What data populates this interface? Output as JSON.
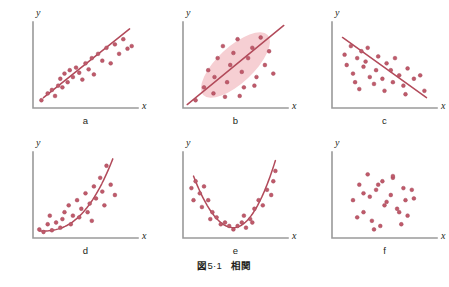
{
  "figure": {
    "caption_label": "図",
    "caption_number": "5·1",
    "caption_title": "相関",
    "background_color": "#ffffff",
    "axis_color": "#9a9a9a",
    "point_color": "#c05a6a",
    "point_stroke_color": "#a4485c",
    "curve_color": "#b24a5a",
    "ellipse_fill_color": "#f6cfd3",
    "label_color": "#231f20",
    "axis_label_x": "x",
    "axis_label_y": "y",
    "point_radius": 1.9,
    "panel_width": 149.6,
    "panel_height": 130
  },
  "chart_data": [
    {
      "type": "scatter",
      "panel_id": "a",
      "label": "a",
      "title": "",
      "xlabel": "x",
      "ylabel": "y",
      "xlim": [
        0,
        100
      ],
      "ylim": [
        0,
        100
      ],
      "grid": false,
      "legend": "none",
      "annotation": "strong positive linear correlation",
      "fit": {
        "kind": "line",
        "x1": 10,
        "y1": 12,
        "x2": 92,
        "y2": 92
      },
      "ellipse": null,
      "x": [
        8,
        14,
        18,
        21,
        24,
        26,
        28,
        30,
        33,
        35,
        38,
        41,
        44,
        47,
        50,
        53,
        56,
        58,
        62,
        66,
        70,
        74,
        78,
        82,
        86,
        90,
        94
      ],
      "y": [
        9,
        17,
        21,
        14,
        26,
        34,
        24,
        40,
        30,
        44,
        36,
        47,
        41,
        33,
        52,
        45,
        58,
        39,
        63,
        55,
        70,
        52,
        74,
        63,
        80,
        69,
        72
      ]
    },
    {
      "type": "scatter",
      "panel_id": "b",
      "label": "b",
      "title": "",
      "xlabel": "x",
      "ylabel": "y",
      "xlim": [
        0,
        100
      ],
      "ylim": [
        0,
        100
      ],
      "grid": false,
      "legend": "none",
      "annotation": "positive correlation with confidence ellipse",
      "fit": {
        "kind": "line",
        "x1": 4,
        "y1": 4,
        "x2": 96,
        "y2": 96
      },
      "ellipse": {
        "cx": 50,
        "cy": 50,
        "rx": 42,
        "ry": 21,
        "rotation_deg": -43
      },
      "x": [
        12,
        20,
        24,
        29,
        33,
        30,
        38,
        42,
        45,
        48,
        40,
        52,
        56,
        58,
        62,
        54,
        66,
        70,
        74,
        68,
        78,
        82,
        86
      ],
      "y": [
        9,
        24,
        44,
        17,
        58,
        36,
        72,
        30,
        50,
        64,
        13,
        80,
        42,
        24,
        58,
        14,
        70,
        36,
        82,
        26,
        50,
        66,
        40
      ]
    },
    {
      "type": "scatter",
      "panel_id": "c",
      "label": "c",
      "title": "",
      "xlabel": "x",
      "ylabel": "y",
      "xlim": [
        0,
        100
      ],
      "ylim": [
        0,
        100
      ],
      "grid": false,
      "legend": "none",
      "annotation": "negative linear correlation",
      "fit": {
        "kind": "line",
        "x1": 10,
        "y1": 82,
        "x2": 90,
        "y2": 12
      },
      "ellipse": null,
      "x": [
        12,
        14,
        18,
        20,
        24,
        22,
        28,
        30,
        26,
        34,
        36,
        32,
        40,
        44,
        42,
        48,
        52,
        50,
        56,
        60,
        58,
        64,
        68,
        72,
        70,
        78,
        84,
        88
      ],
      "y": [
        62,
        50,
        72,
        40,
        58,
        30,
        66,
        48,
        22,
        70,
        36,
        54,
        28,
        60,
        44,
        34,
        52,
        20,
        44,
        58,
        30,
        38,
        26,
        46,
        16,
        34,
        38,
        20
      ]
    },
    {
      "type": "scatter",
      "panel_id": "d",
      "label": "d",
      "title": "",
      "xlabel": "x",
      "ylabel": "y",
      "xlim": [
        0,
        100
      ],
      "ylim": [
        0,
        100
      ],
      "grid": false,
      "legend": "none",
      "annotation": "increasing exponential (non-linear) relationship",
      "fit": {
        "kind": "exponential",
        "x_start": 6,
        "x_end": 76,
        "y_start": 8,
        "y_end": 92,
        "curvature": 2.6
      },
      "ellipse": null,
      "x": [
        6,
        10,
        14,
        18,
        16,
        22,
        26,
        30,
        28,
        34,
        38,
        36,
        42,
        46,
        44,
        50,
        54,
        52,
        58,
        60,
        56,
        64,
        66,
        70,
        68,
        74,
        78
      ],
      "y": [
        10,
        7,
        16,
        9,
        26,
        18,
        12,
        30,
        22,
        38,
        26,
        16,
        44,
        34,
        24,
        52,
        40,
        30,
        60,
        46,
        20,
        70,
        54,
        84,
        38,
        62,
        50
      ]
    },
    {
      "type": "scatter",
      "panel_id": "e",
      "label": "e",
      "title": "",
      "xlabel": "x",
      "ylabel": "y",
      "xlim": [
        0,
        100
      ],
      "ylim": [
        0,
        100
      ],
      "grid": false,
      "legend": "none",
      "annotation": "U-shaped (quadratic) relationship",
      "fit": {
        "kind": "parabola",
        "vertex_x": 48,
        "vertex_y": 12,
        "x_start": 10,
        "x_end": 88,
        "y_start": 72,
        "y_end": 90
      },
      "ellipse": null,
      "x": [
        8,
        12,
        10,
        16,
        20,
        18,
        24,
        28,
        26,
        32,
        36,
        40,
        44,
        48,
        52,
        56,
        60,
        58,
        64,
        68,
        66,
        72,
        76,
        80,
        84,
        88,
        86
      ],
      "y": [
        58,
        66,
        44,
        52,
        60,
        36,
        44,
        30,
        22,
        24,
        16,
        18,
        14,
        10,
        14,
        18,
        12,
        26,
        22,
        34,
        18,
        44,
        38,
        56,
        50,
        78,
        66
      ]
    },
    {
      "type": "scatter",
      "panel_id": "f",
      "label": "f",
      "title": "",
      "xlabel": "x",
      "ylabel": "y",
      "xlim": [
        0,
        100
      ],
      "ylim": [
        0,
        100
      ],
      "grid": false,
      "legend": "none",
      "annotation": "no correlation (random scatter)",
      "fit": null,
      "ellipse": null,
      "x": [
        20,
        26,
        34,
        30,
        42,
        38,
        48,
        52,
        46,
        58,
        62,
        56,
        68,
        72,
        66,
        78,
        24,
        36,
        50,
        64,
        76,
        44,
        30,
        58,
        70,
        40
      ],
      "y": [
        44,
        62,
        74,
        30,
        56,
        20,
        66,
        42,
        14,
        70,
        34,
        50,
        58,
        26,
        16,
        46,
        24,
        48,
        38,
        30,
        56,
        62,
        52,
        72,
        44,
        10
      ]
    }
  ]
}
